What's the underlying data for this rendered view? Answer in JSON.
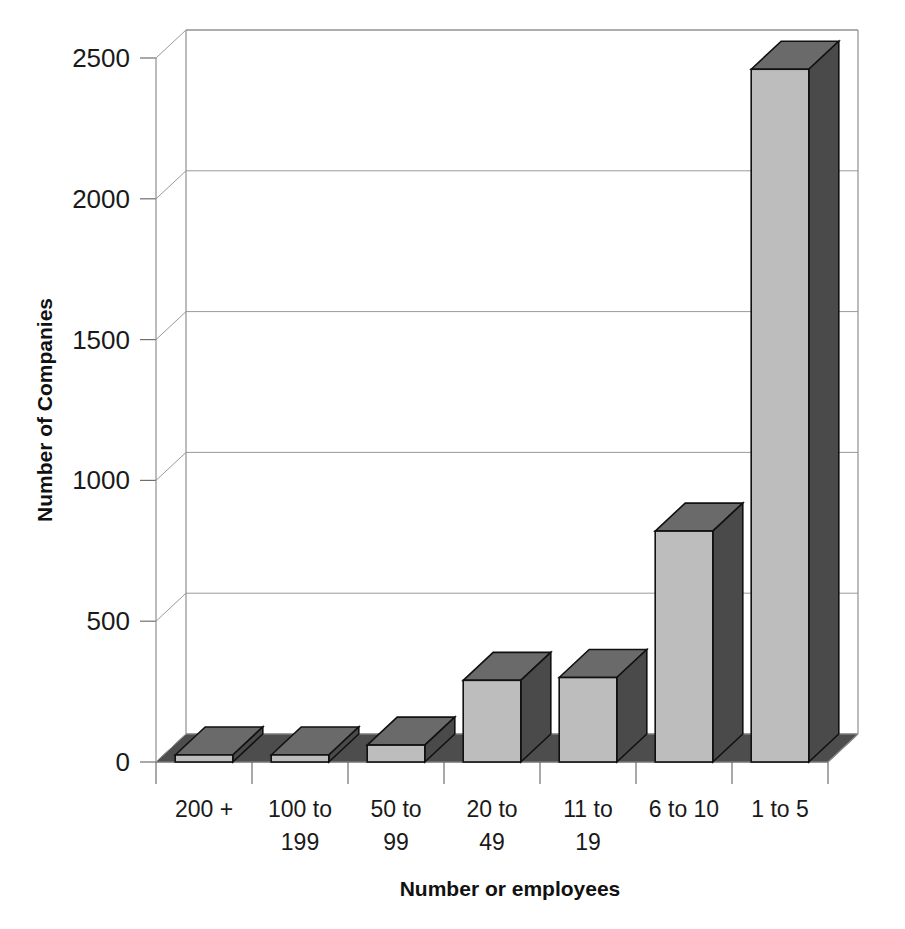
{
  "chart_data": {
    "type": "bar",
    "title": "",
    "subtitle": "",
    "xlabel": "Number or employees",
    "ylabel": "Number of Companies",
    "categories": [
      "200 +",
      "100 to 199",
      "50 to 99",
      "20 to 49",
      "11 to 19",
      "6 to 10",
      "1 to 5"
    ],
    "values": [
      25,
      25,
      60,
      290,
      300,
      820,
      2460
    ],
    "series": [
      {
        "name": "Number of Companies",
        "values": [
          25,
          25,
          60,
          290,
          300,
          820,
          2460
        ]
      }
    ],
    "ylim": [
      0,
      2500
    ],
    "ytick_labels": [
      "0",
      "500",
      "1000",
      "1500",
      "2000",
      "2500"
    ],
    "ytick_values": [
      0,
      500,
      1000,
      1500,
      2000,
      2500
    ],
    "grid": true,
    "legend": false,
    "legend_position": "none",
    "three_d": true,
    "annotations": []
  },
  "style": {
    "bar_front_color": "#bdbdbd",
    "bar_top_color": "#6a6a6a",
    "bar_side_color": "#4a4a4a",
    "floor_color": "#4d4d4d",
    "grid_color": "#9a9a9a",
    "axis_color": "#8f8f8f",
    "text_color": "#1a1a1a",
    "background_color": "#ffffff"
  },
  "axis": {
    "y_title": "Number of Companies",
    "x_title": "Number or employees"
  },
  "ticks": {
    "t0": "0",
    "t1": "500",
    "t2": "1000",
    "t3": "1500",
    "t4": "2000",
    "t5": "2500"
  },
  "categories": {
    "c0_line1": "200 +",
    "c0_line2": "",
    "c1_line1": "100 to",
    "c1_line2": "199",
    "c2_line1": "50 to",
    "c2_line2": "99",
    "c3_line1": "20 to",
    "c3_line2": "49",
    "c4_line1": "11 to",
    "c4_line2": "19",
    "c5_line1": "6 to 10",
    "c5_line2": "",
    "c6_line1": "1 to 5",
    "c6_line2": ""
  }
}
